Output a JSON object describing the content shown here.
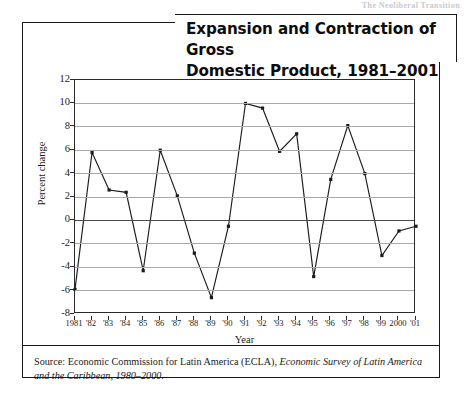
{
  "running_head": "The Neoliberal Transition",
  "figure": {
    "title": "Expansion and Contraction of Gross Domestic Product, 1981–2001",
    "title_line1": "Expansion and Contraction of Gross",
    "title_line2": "Domestic Product, 1981–2001",
    "source_prefix": "Source: Economic Commission for Latin America (ECLA), ",
    "source_italic": "Economic Survey of Latin America and the Caribbean, 1980–2000",
    "source_suffix": "."
  },
  "chart_data": {
    "type": "line",
    "title": "Expansion and Contraction of Gross Domestic Product, 1981–2001",
    "xlabel": "Year",
    "ylabel": "Percent change",
    "ylim": [
      -8,
      12
    ],
    "yticks": [
      12,
      10,
      8,
      6,
      4,
      2,
      0,
      -2,
      -4,
      -6,
      -8
    ],
    "ytick_labels": [
      "12",
      "10",
      "8",
      "6",
      "4",
      "2",
      "0",
      "-2",
      "-4",
      "-6",
      "-8"
    ],
    "grid": true,
    "legend": "none",
    "marker": "square",
    "line_color": "#1a1a1a",
    "categories": [
      "1981",
      "'82",
      "'83",
      "'84",
      "'85",
      "'86",
      "'87",
      "'88",
      "'89",
      "'90",
      "'91",
      "'92",
      "'93",
      "'94",
      "'95",
      "'96",
      "'97",
      "'98",
      "'99",
      "2000",
      "'01"
    ],
    "x": [
      1981,
      1982,
      1983,
      1984,
      1985,
      1986,
      1987,
      1988,
      1989,
      1990,
      1991,
      1992,
      1993,
      1994,
      1995,
      1996,
      1997,
      1998,
      1999,
      2000,
      2001
    ],
    "values": [
      -5.9,
      5.8,
      2.6,
      2.4,
      -4.3,
      6.0,
      2.1,
      -2.8,
      -6.6,
      -0.5,
      10.0,
      9.6,
      5.9,
      7.4,
      -4.8,
      3.5,
      8.1,
      4.0,
      -3.0,
      -0.9,
      -0.5
    ]
  }
}
